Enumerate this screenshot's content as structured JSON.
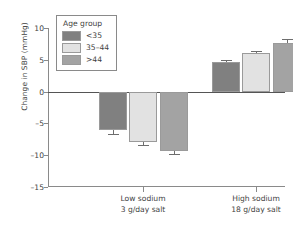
{
  "chart_data": {
    "type": "bar",
    "title": "",
    "xlabel": "",
    "ylabel": "Change in SBP (mmHg)",
    "ylim": [
      -15,
      10
    ],
    "yticks": [
      10,
      5,
      0,
      -5,
      -10,
      -15
    ],
    "ytick_labels": [
      "10",
      "5",
      "0",
      "–5",
      "–10",
      "–15"
    ],
    "grid": false,
    "legend_position": "upper-left-inside",
    "legend_title": "Age group",
    "categories": [
      "Low sodium\n3 g/day salt",
      "High sodium\n18 g/day salt"
    ],
    "category_labels": [
      {
        "line1": "Low sodium",
        "line2": "3 g/day salt"
      },
      {
        "line1": "High sodium",
        "line2": "18 g/day salt"
      }
    ],
    "series": [
      {
        "name": "<35",
        "color": "#808080",
        "values": [
          -6.1,
          4.6
        ],
        "errors": [
          0.6,
          0.35
        ]
      },
      {
        "name": "35–44",
        "color": "#e2e2e2",
        "values": [
          -8.0,
          6.0
        ],
        "errors": [
          0.45,
          0.35
        ]
      },
      {
        "name": ">44",
        "color": "#a3a3a3",
        "values": [
          -9.3,
          7.7
        ],
        "errors": [
          0.5,
          0.5
        ]
      }
    ]
  },
  "colors": {
    "axis": "#8a8a8a",
    "zero_line": "#555555",
    "text": "#3f3f3f",
    "error_bar": "#6d6d6d",
    "background": "#ffffff"
  }
}
